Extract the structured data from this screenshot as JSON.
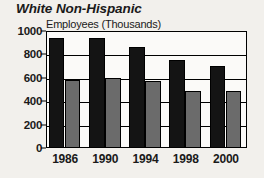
{
  "chart_data": {
    "type": "bar",
    "title": "White Non-Hispanic",
    "xlabel": "",
    "ylabel": "Employees (Thousands)",
    "categories": [
      "1986",
      "1990",
      "1994",
      "1998",
      "2000"
    ],
    "series": [
      {
        "name": "series-a",
        "color": "#141414",
        "values": [
          940,
          940,
          865,
          755,
          700
        ]
      },
      {
        "name": "series-b",
        "color": "#6b6b6b",
        "values": [
          580,
          600,
          575,
          490,
          490
        ]
      }
    ],
    "ylim": [
      0,
      1000
    ],
    "yticks": [
      0,
      200,
      400,
      600,
      800,
      1000
    ],
    "ytick_labels": [
      "0",
      "200",
      "400",
      "600",
      "800",
      "1000"
    ],
    "grid": true,
    "legend": "none",
    "background": "#f2f0ec",
    "axis_color": "#000000"
  }
}
